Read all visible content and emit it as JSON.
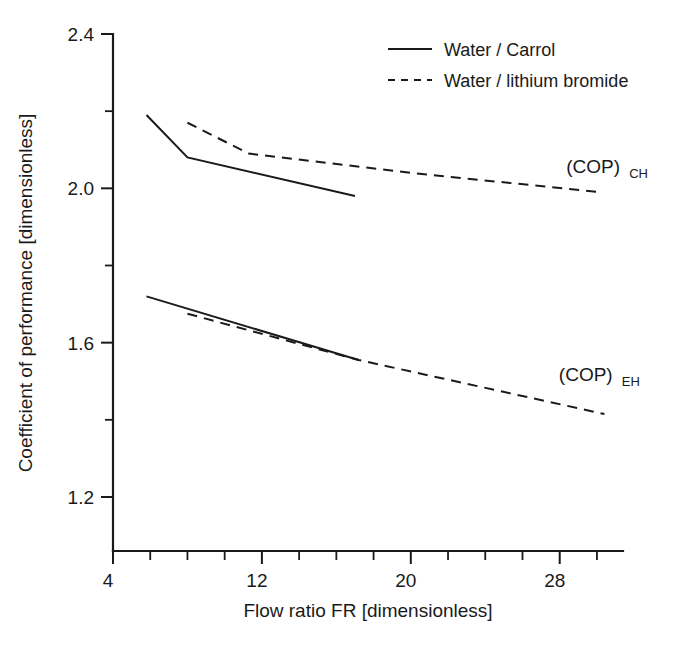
{
  "chart_data": {
    "type": "line",
    "title": "",
    "xlabel": "Flow ratio FR [dimensionless]",
    "ylabel": "Coefficient of performance [dimensionless]",
    "xlim": [
      4,
      31.4
    ],
    "ylim": [
      1.06,
      2.4
    ],
    "grid": false,
    "x_ticks_major": [
      4,
      12,
      20,
      28
    ],
    "x_tick_labels": [
      "4",
      "12",
      "20",
      "28"
    ],
    "x_ticks_minor": [
      6,
      8,
      10,
      14,
      16,
      18,
      22,
      24,
      26,
      30
    ],
    "y_ticks_major": [
      2.4,
      2.0,
      1.6,
      1.2
    ],
    "y_tick_labels": [
      "2.4",
      "2.0",
      "1.6",
      "1.2"
    ],
    "y_ticks_minor": [
      2.2,
      1.8,
      1.4
    ],
    "legend_position": "top-center-right",
    "legend": [
      {
        "label": "Water / Carrol",
        "style": "solid"
      },
      {
        "label": "Water / lithium bromide",
        "style": "dashed"
      }
    ],
    "annotations": [
      {
        "text": "(COP)",
        "sub": "CH",
        "x": 29.8,
        "y": 2.04
      },
      {
        "text": "(COP)",
        "sub": "EH",
        "x": 29.4,
        "y": 1.5
      }
    ],
    "series": [
      {
        "name": "Water / Carrol — (COP)CH",
        "style": "solid",
        "group": "COP_CH",
        "points": [
          {
            "x": 5.8,
            "y": 2.19
          },
          {
            "x": 8.0,
            "y": 2.08
          },
          {
            "x": 17.0,
            "y": 1.98
          }
        ]
      },
      {
        "name": "Water / lithium bromide — (COP)CH",
        "style": "dashed",
        "group": "COP_CH",
        "points": [
          {
            "x": 8.0,
            "y": 2.17
          },
          {
            "x": 11.3,
            "y": 2.09
          },
          {
            "x": 20.0,
            "y": 2.04
          },
          {
            "x": 30.2,
            "y": 1.99
          }
        ]
      },
      {
        "name": "Water / Carrol — (COP)EH",
        "style": "solid",
        "group": "COP_EH",
        "points": [
          {
            "x": 5.8,
            "y": 1.72
          },
          {
            "x": 17.2,
            "y": 1.555
          }
        ]
      },
      {
        "name": "Water / lithium bromide — (COP)EH",
        "style": "dashed",
        "group": "COP_EH",
        "points": [
          {
            "x": 8.0,
            "y": 1.675
          },
          {
            "x": 17.2,
            "y": 1.555
          },
          {
            "x": 30.4,
            "y": 1.415
          }
        ]
      }
    ]
  }
}
